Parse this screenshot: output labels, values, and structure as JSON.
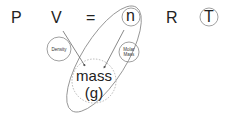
{
  "equation": {
    "P": "P",
    "V": "V",
    "equals": "=",
    "n": "n",
    "R": "R",
    "T": "T"
  },
  "nodes": {
    "density": "Density",
    "molar_mass_line1": "Molar",
    "molar_mass_line2": "Mass",
    "mass_line1": "mass",
    "mass_line2": "(g)"
  },
  "colors": {
    "text": "#222222",
    "stroke": "#888888",
    "arrow": "#555555"
  }
}
